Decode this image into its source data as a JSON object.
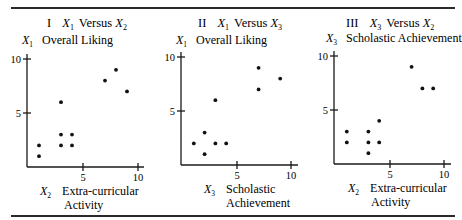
{
  "chart_data": [
    {
      "type": "scatter",
      "panel": "I",
      "title": "I X1 Versus X2",
      "title_parts": {
        "roman": "I",
        "yvar": "X",
        "ysub": "1",
        "versus": "Versus",
        "xvar": "X",
        "xsub": "2"
      },
      "ylabel": {
        "var": "X",
        "sub": "1",
        "text": "Overall Liking"
      },
      "xlabel": {
        "var": "X",
        "sub": "2",
        "line1": "Extra-curricular",
        "line2": "Activity"
      },
      "x_ticks": [
        "5",
        "10"
      ],
      "y_ticks": [
        "5",
        "10"
      ],
      "xlim": [
        0,
        10.5
      ],
      "ylim": [
        0,
        10.5
      ],
      "grid": false,
      "points": [
        [
          1,
          2
        ],
        [
          1,
          1
        ],
        [
          3,
          6
        ],
        [
          3,
          3
        ],
        [
          4,
          3
        ],
        [
          3,
          2
        ],
        [
          4,
          2
        ],
        [
          7,
          8
        ],
        [
          8,
          9
        ],
        [
          9,
          7
        ]
      ]
    },
    {
      "type": "scatter",
      "panel": "II",
      "title": "II X1 Versus X3",
      "title_parts": {
        "roman": "II",
        "yvar": "X",
        "ysub": "1",
        "versus": "Versus",
        "xvar": "X",
        "xsub": "3"
      },
      "ylabel": {
        "var": "X",
        "sub": "1",
        "text": "Overall Liking"
      },
      "xlabel": {
        "var": "X",
        "sub": "3",
        "line1": "Scholastic",
        "line2": "Achievement"
      },
      "x_ticks": [
        "5",
        "10"
      ],
      "y_ticks": [
        "5",
        "10"
      ],
      "xlim": [
        0,
        10.5
      ],
      "ylim": [
        0,
        10.5
      ],
      "grid": false,
      "points": [
        [
          1,
          2
        ],
        [
          2,
          3
        ],
        [
          2,
          1
        ],
        [
          3,
          2
        ],
        [
          4,
          2
        ],
        [
          3,
          6
        ],
        [
          7,
          7
        ],
        [
          7,
          9
        ],
        [
          9,
          8
        ]
      ]
    },
    {
      "type": "scatter",
      "panel": "III",
      "title": "III X3 Versus X2",
      "title_parts": {
        "roman": "III",
        "yvar": "X",
        "ysub": "3",
        "versus": "Versus",
        "xvar": "X",
        "xsub": "2"
      },
      "ylabel": {
        "var": "X",
        "sub": "3",
        "text": "Scholastic Achievement"
      },
      "xlabel": {
        "var": "X",
        "sub": "2",
        "line1": "Extra-curricular",
        "line2": "Activity"
      },
      "x_ticks": [
        "5",
        "10"
      ],
      "y_ticks": [
        "5",
        "10"
      ],
      "xlim": [
        0,
        10.5
      ],
      "ylim": [
        0,
        10.5
      ],
      "grid": false,
      "points": [
        [
          1,
          3
        ],
        [
          1,
          2
        ],
        [
          3,
          3
        ],
        [
          3,
          2
        ],
        [
          3,
          1
        ],
        [
          4,
          4
        ],
        [
          4,
          2
        ],
        [
          7,
          9
        ],
        [
          8,
          7
        ],
        [
          9,
          7
        ]
      ]
    }
  ]
}
